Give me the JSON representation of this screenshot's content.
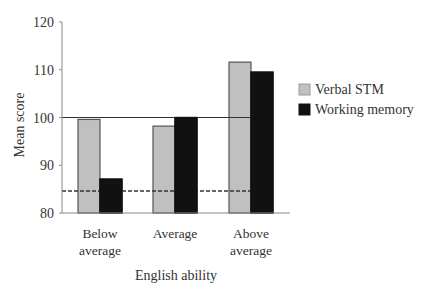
{
  "chart_data": {
    "type": "bar",
    "title": "",
    "xlabel": "English ability",
    "ylabel": "Mean score",
    "categories": [
      [
        "Below",
        "average"
      ],
      [
        "Average"
      ],
      [
        "Above",
        "average"
      ]
    ],
    "series": [
      {
        "name": "Verbal STM",
        "color": "#c0c0c0",
        "values": [
          99.6,
          98.2,
          111.6
        ]
      },
      {
        "name": "Working memory",
        "color": "#111111",
        "values": [
          87.1,
          100.0,
          109.5
        ]
      }
    ],
    "ylim": [
      80,
      120
    ],
    "yticks": [
      80,
      90,
      100,
      110,
      120
    ],
    "reference_lines": [
      {
        "value": 100,
        "style": "solid"
      },
      {
        "value": 84.6,
        "style": "dashed"
      }
    ],
    "grid": false,
    "legend_position": "right"
  }
}
